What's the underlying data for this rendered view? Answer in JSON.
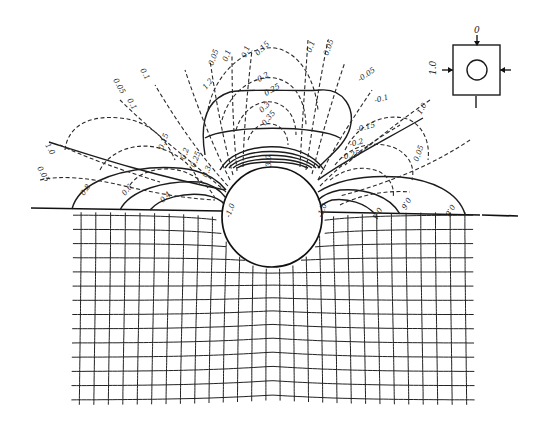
{
  "figure": {
    "inset": {
      "top_label": "0",
      "left_label": "1.0"
    },
    "solid_contour_labels": {
      "left": [
        "0.8",
        "0.6",
        "0.4",
        "1.0",
        "1.2"
      ],
      "right": [
        "0.8",
        "0.6",
        "0.4",
        "1.0"
      ],
      "center": "3.0",
      "hole_left": "-1.0",
      "hole_right": "-1.0"
    },
    "dashed_contour_labels": {
      "left": [
        "0.1",
        "0.05",
        "0.1",
        "0.05",
        "0.15",
        "0.2",
        "0.25",
        "0.3"
      ],
      "top": [
        "0.1",
        "0.05",
        "0.1",
        "0.15",
        "0.2",
        "0.25",
        "0.3",
        "0.35"
      ],
      "right": [
        "0.1",
        "0.05",
        "-0.05",
        "-0.1",
        "-0.15",
        "-0.2",
        "-0.25",
        "0.05"
      ]
    }
  }
}
